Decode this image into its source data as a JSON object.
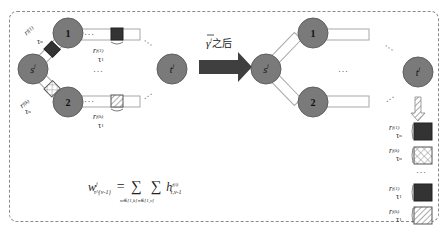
{
  "diagram": {
    "type": "network-state-transition",
    "colors": {
      "node_fill": "#7a7a7a",
      "node_stroke": "#5e5e5e",
      "link_fill": "#ffffff",
      "link_stroke": "#a8a8a8",
      "packet_dark": "#333333",
      "arrow": "#3f3f3f",
      "frame_border": "#8a8a8a"
    },
    "left_network": {
      "source_node": {
        "label": "s",
        "sup": "j"
      },
      "relay_nodes": [
        {
          "label": "1"
        },
        {
          "label": "2"
        }
      ],
      "dest_node": {
        "label": "t",
        "sup": "j"
      },
      "packet_labels": [
        {
          "r": "r",
          "sup": "f(1)",
          "tau": "τ",
          "tau_sup": "n",
          "position": "link s-1"
        },
        {
          "r": "r",
          "sup": "f(k)",
          "tau": "τ",
          "tau_sup": "n",
          "position": "link s-2"
        },
        {
          "r": "r",
          "sup": "f(1)",
          "tau": "τ",
          "tau_sup": "1",
          "position": "link 1-out"
        },
        {
          "r": "r",
          "sup": "f(k)",
          "tau": "τ",
          "tau_sup": "1",
          "position": "link 2-out"
        }
      ],
      "ellipsis": "···"
    },
    "transition_arrow": {
      "label_symbol": "γ",
      "label_sup": "j",
      "label_text": "之后"
    },
    "right_network": {
      "source_node": {
        "label": "s",
        "sup": "j"
      },
      "relay_nodes": [
        {
          "label": "1"
        },
        {
          "label": "2"
        }
      ],
      "dest_node": {
        "label": "t",
        "sup": "j"
      },
      "ellipsis": "···",
      "received_stack": [
        {
          "r": "r",
          "sup": "f(1)",
          "tau": "τ",
          "tau_sup": "n",
          "pattern": "solid-dark"
        },
        {
          "r": "r",
          "sup": "f(k)",
          "tau": "τ",
          "tau_sup": "n",
          "pattern": "crosshatch"
        },
        {
          "r": "r",
          "sup": "f(1)",
          "tau": "τ",
          "tau_sup": "1",
          "pattern": "solid-dark"
        },
        {
          "r": "r",
          "sup": "f(k)",
          "tau": "τ",
          "tau_sup": "1",
          "pattern": "diagonal"
        }
      ]
    },
    "formula": {
      "lhs": "w",
      "lhs_sup": "j",
      "lhs_sub": "τ^{v-1}",
      "equals": "=",
      "sum1": "∑",
      "sum1_limit": "m∈[1,k]",
      "sum2": "∑",
      "sum2_limit": "n∈[1,v]",
      "term": "h",
      "term_sup": "f(i)",
      "term_sub": "τ,v-1"
    }
  }
}
